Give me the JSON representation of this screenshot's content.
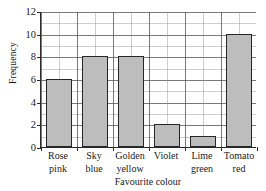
{
  "chart_data": {
    "type": "bar",
    "title": "",
    "xlabel": "Favourite colour",
    "ylabel": "Frequency",
    "categories": [
      "Rose pink",
      "Sky blue",
      "Golden yellow",
      "Violet",
      "Lime green",
      "Tomato red"
    ],
    "category_lines": [
      [
        "Rose",
        "pink"
      ],
      [
        "Sky",
        "blue"
      ],
      [
        "Golden",
        "yellow"
      ],
      [
        "Violet",
        ""
      ],
      [
        "Lime",
        "green"
      ],
      [
        "Tomato",
        "red"
      ]
    ],
    "values": [
      6,
      8,
      8,
      2,
      1,
      10
    ],
    "ylim": [
      0,
      12
    ],
    "ytick_labels": [
      "0",
      "2",
      "4",
      "6",
      "8",
      "10",
      "12"
    ],
    "ytick_values": [
      0,
      2,
      4,
      6,
      8,
      10,
      12
    ],
    "y_minor_step": 1,
    "grid": true,
    "legend": "none",
    "bar_fill_color": "#bdbdbd",
    "bar_edge_color": "#262626",
    "axis_color": "#2a2a2a",
    "grid_major_color": "#464646",
    "grid_minor_color": "#8c8c8c"
  }
}
